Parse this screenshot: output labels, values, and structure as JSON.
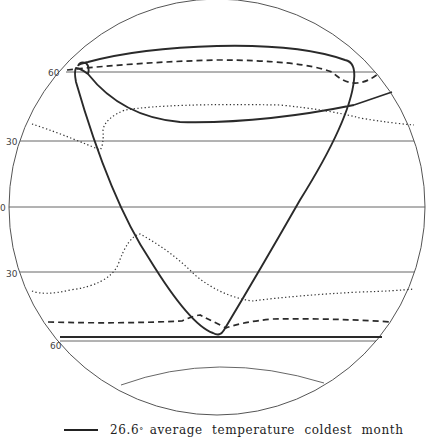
{
  "diagram": {
    "latitude_labels": [
      {
        "label": "60",
        "y": 72
      },
      {
        "label": "30",
        "y": 141
      },
      {
        "label": "0",
        "y": 207
      },
      {
        "label": "30",
        "y": 273
      },
      {
        "label": "60",
        "y": 345
      }
    ],
    "colors": {
      "line": "#2a2a2a",
      "thin_line": "#555555",
      "background": "#ffffff"
    }
  },
  "legend": {
    "items": [
      {
        "symbol": "solid-line",
        "value": "26.6",
        "unit_mark": "°",
        "label": "average temperature coldest month"
      }
    ]
  }
}
